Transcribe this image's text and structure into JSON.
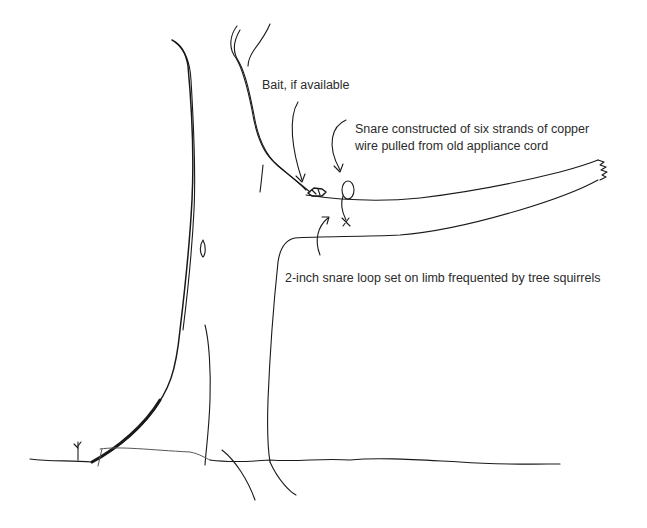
{
  "diagram": {
    "annotations": {
      "bait": "Bait, if available",
      "snare_line1": "Snare constructed of six strands of copper",
      "snare_line2": "wire pulled from old appliance cord",
      "loop": "2-inch snare loop set on limb frequented by tree squirrels"
    },
    "elements": [
      {
        "id": "tree-trunk",
        "description": "Tall tree trunk sketch"
      },
      {
        "id": "limb",
        "description": "Horizontal limb extending right with broken end"
      },
      {
        "id": "bait",
        "description": "Small bait object on limb near trunk"
      },
      {
        "id": "snare-loop",
        "description": "Small wire loop standing on limb"
      },
      {
        "id": "ground-line",
        "description": "Ground line across the bottom"
      },
      {
        "id": "seedling",
        "description": "Small sprout at base of tree"
      }
    ],
    "colors": {
      "ink": "#1a1a1a",
      "text": "#2b2b2b",
      "background": "#ffffff"
    }
  }
}
